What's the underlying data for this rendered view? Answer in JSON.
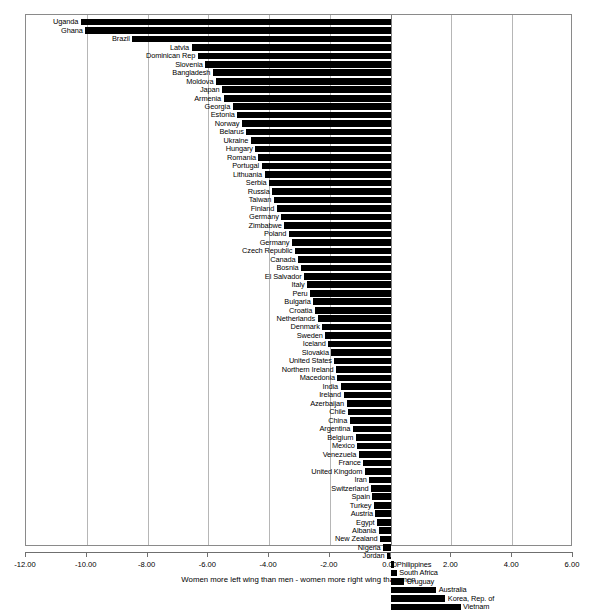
{
  "chart_data": {
    "type": "bar",
    "orientation": "horizontal",
    "title": "",
    "subtitle": "",
    "xlabel": "Women more left wing than men - women more right wing than men",
    "ylabel": "",
    "xlim": [
      -12.0,
      6.0
    ],
    "xticks": [
      "-12.00",
      "-10.00",
      "-8.00",
      "-6.00",
      "-4.00",
      "-2.00",
      "0.00",
      "2.00",
      "4.00",
      "6.00"
    ],
    "xtick_values": [
      -12,
      -10,
      -8,
      -6,
      -4,
      -2,
      0,
      2,
      4,
      6
    ],
    "grid": true,
    "grid_axis": "x",
    "legend": "none",
    "bar_color": "#000000",
    "categories": [
      "Uganda",
      "Ghana",
      "Brazil",
      "Latvia",
      "Dominican Rep",
      "Slovenia",
      "Bangladesh",
      "Moldova",
      "Japan",
      "Armenia",
      "Georgia",
      "Estonia",
      "Norway",
      "Belarus",
      "Ukraine",
      "Hungary",
      "Romania",
      "Portugal",
      "Lithuania",
      "Serbia",
      "Russia",
      "Taiwan",
      "Finland",
      "Germany",
      "Zimbabwe",
      "Poland",
      "Germany",
      "Czech Republic",
      "Canada",
      "Bosnia",
      "El Salvador",
      "Italy",
      "Peru",
      "Bulgaria",
      "Croatia",
      "Netherlands",
      "Denmark",
      "Sweden",
      "Iceland",
      "Slovakia",
      "United States",
      "Northern Ireland",
      "Macedonia",
      "India",
      "Ireland",
      "Azerbaijan",
      "Chile",
      "China",
      "Argentina",
      "Belgium",
      "Mexico",
      "Venezuela",
      "France",
      "United Kingdom",
      "Iran",
      "Switzerland",
      "Spain",
      "Turkey",
      "Austria",
      "Egypt",
      "Albania",
      "New Zealand",
      "Nigeria",
      "Jordan",
      "Philippines",
      "South Africa",
      "Uruguay",
      "Australia",
      "Korea, Rep. of",
      "Vietnam"
    ],
    "values": [
      -10.2,
      -10.05,
      -8.5,
      -6.55,
      -6.35,
      -6.1,
      -5.85,
      -5.75,
      -5.55,
      -5.5,
      -5.2,
      -5.05,
      -4.9,
      -4.75,
      -4.6,
      -4.45,
      -4.35,
      -4.25,
      -4.15,
      -4.0,
      -3.9,
      -3.85,
      -3.75,
      -3.6,
      -3.5,
      -3.35,
      -3.25,
      -3.15,
      -3.05,
      -2.95,
      -2.85,
      -2.75,
      -2.65,
      -2.55,
      -2.5,
      -2.4,
      -2.25,
      -2.15,
      -2.05,
      -1.95,
      -1.85,
      -1.8,
      -1.75,
      -1.65,
      -1.55,
      -1.45,
      -1.4,
      -1.35,
      -1.25,
      -1.15,
      -1.1,
      -1.05,
      -0.9,
      -0.85,
      -0.7,
      -0.65,
      -0.6,
      -0.55,
      -0.5,
      -0.45,
      -0.4,
      -0.35,
      -0.25,
      -0.12,
      0.12,
      0.2,
      0.45,
      1.5,
      1.8,
      2.3
    ],
    "label_side": [
      "left",
      "left",
      "left",
      "left",
      "left",
      "left",
      "left",
      "left",
      "left",
      "left",
      "left",
      "left",
      "left",
      "left",
      "left",
      "left",
      "left",
      "left",
      "left",
      "left",
      "left",
      "left",
      "left",
      "left",
      "left",
      "left",
      "left",
      "left",
      "left",
      "left",
      "left",
      "left",
      "left",
      "left",
      "left",
      "left",
      "left",
      "left",
      "left",
      "left",
      "left",
      "left",
      "left",
      "left",
      "left",
      "left",
      "left",
      "left",
      "left",
      "left",
      "left",
      "left",
      "left",
      "left",
      "left",
      "left",
      "left",
      "left",
      "left",
      "left",
      "left",
      "left",
      "left",
      "left",
      "right",
      "right",
      "right",
      "right",
      "right",
      "right"
    ]
  }
}
